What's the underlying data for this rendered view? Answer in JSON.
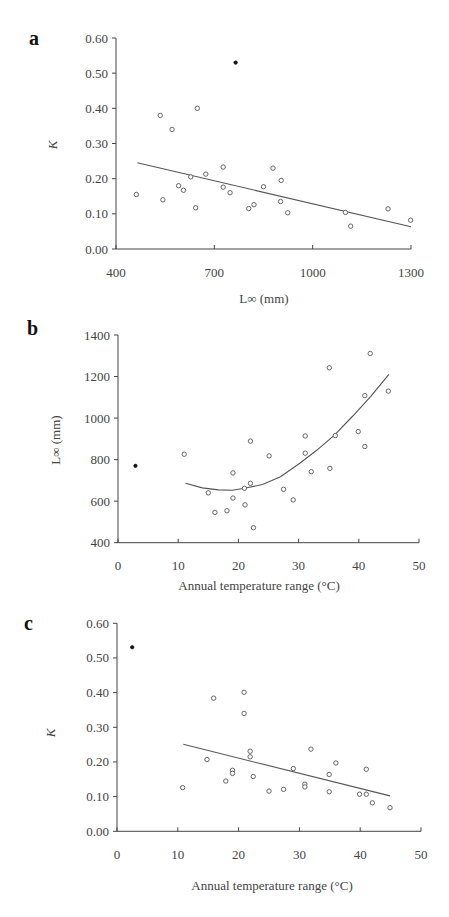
{
  "chart_data": [
    {
      "panel": "a",
      "type": "scatter",
      "title": "",
      "xlabel": "L∞ (mm)",
      "ylabel": "K",
      "xlim": [
        400,
        1300
      ],
      "ylim": [
        0.0,
        0.6
      ],
      "xticks": [
        400,
        700,
        1000,
        1300
      ],
      "xtick_labels": [
        "400",
        "700",
        "1000",
        "1300"
      ],
      "yticks": [
        0.0,
        0.1,
        0.2,
        0.3,
        0.4,
        0.5,
        0.6
      ],
      "ytick_labels": [
        "0.00",
        "0.10",
        "0.20",
        "0.30",
        "0.40",
        "0.50",
        "0.60"
      ],
      "grid": false,
      "legend": null,
      "series": [
        {
          "name": "open",
          "marker": "open-circle",
          "points": [
            [
              462,
              0.155
            ],
            [
              535,
              0.38
            ],
            [
              543,
              0.14
            ],
            [
              571,
              0.34
            ],
            [
              591,
              0.18
            ],
            [
              606,
              0.167
            ],
            [
              628,
              0.205
            ],
            [
              643,
              0.117
            ],
            [
              648,
              0.4
            ],
            [
              674,
              0.213
            ],
            [
              727,
              0.233
            ],
            [
              727,
              0.176
            ],
            [
              748,
              0.16
            ],
            [
              805,
              0.115
            ],
            [
              821,
              0.126
            ],
            [
              850,
              0.177
            ],
            [
              879,
              0.23
            ],
            [
              902,
              0.135
            ],
            [
              904,
              0.195
            ],
            [
              924,
              0.103
            ],
            [
              1100,
              0.104
            ],
            [
              1116,
              0.065
            ],
            [
              1230,
              0.114
            ],
            [
              1299,
              0.082
            ]
          ]
        },
        {
          "name": "outlier",
          "marker": "filled-circle",
          "points": [
            [
              765,
              0.53
            ]
          ]
        }
      ],
      "fit": {
        "type": "linear",
        "points": [
          [
            465,
            0.245
          ],
          [
            1300,
            0.063
          ]
        ]
      }
    },
    {
      "panel": "b",
      "type": "scatter",
      "title": "",
      "xlabel": "Annual temperature range (°C)",
      "ylabel": "L∞ (mm)",
      "xlim": [
        0,
        50
      ],
      "ylim": [
        400,
        1400
      ],
      "xticks": [
        0,
        10,
        20,
        30,
        40,
        50
      ],
      "xtick_labels": [
        "0",
        "10",
        "20",
        "30",
        "40",
        "50"
      ],
      "yticks": [
        400,
        600,
        800,
        1000,
        1200,
        1400
      ],
      "ytick_labels": [
        "400",
        "600",
        "800",
        "1000",
        "1200",
        "1400"
      ],
      "grid": false,
      "legend": null,
      "series": [
        {
          "name": "open",
          "marker": "open-circle",
          "points": [
            [
              11,
              826
            ],
            [
              15,
              640
            ],
            [
              16.1,
              546
            ],
            [
              18.1,
              554
            ],
            [
              19.1,
              736
            ],
            [
              19.1,
              615
            ],
            [
              21,
              662
            ],
            [
              21.1,
              582
            ],
            [
              22,
              889
            ],
            [
              22,
              686
            ],
            [
              22.5,
              472
            ],
            [
              25.1,
              818
            ],
            [
              27.5,
              657
            ],
            [
              29.1,
              606
            ],
            [
              31.1,
              914
            ],
            [
              31.1,
              831
            ],
            [
              32.1,
              742
            ],
            [
              35.1,
              1242
            ],
            [
              35.2,
              758
            ],
            [
              36.1,
              916
            ],
            [
              39.9,
              935
            ],
            [
              41,
              1108
            ],
            [
              41,
              863
            ],
            [
              41.9,
              1311
            ],
            [
              44.9,
              1130
            ]
          ]
        },
        {
          "name": "outlier",
          "marker": "filled-circle",
          "points": [
            [
              2.9,
              770
            ]
          ]
        }
      ],
      "fit": {
        "type": "quadratic",
        "points": [
          [
            11.2,
            686
          ],
          [
            14,
            664
          ],
          [
            16.7,
            654
          ],
          [
            19,
            653
          ],
          [
            21,
            662
          ],
          [
            24,
            680
          ],
          [
            27,
            718
          ],
          [
            30.2,
            783
          ],
          [
            33,
            845
          ],
          [
            36,
            919
          ],
          [
            39,
            1010
          ],
          [
            42,
            1105
          ],
          [
            45,
            1211
          ]
        ]
      }
    },
    {
      "panel": "c",
      "type": "scatter",
      "title": "",
      "xlabel": "Annual temperature range (°C)",
      "ylabel": "K",
      "xlim": [
        0,
        50
      ],
      "ylim": [
        0.0,
        0.6
      ],
      "xticks": [
        0,
        10,
        20,
        30,
        40,
        50
      ],
      "xtick_labels": [
        "0",
        "10",
        "20",
        "30",
        "40",
        "50"
      ],
      "yticks": [
        0.0,
        0.1,
        0.2,
        0.3,
        0.4,
        0.5,
        0.6
      ],
      "ytick_labels": [
        "0.00",
        "0.10",
        "0.20",
        "0.30",
        "0.40",
        "0.50",
        "0.60"
      ],
      "grid": false,
      "legend": null,
      "series": [
        {
          "name": "open",
          "marker": "open-circle",
          "points": [
            [
              10.8,
              0.126
            ],
            [
              14.8,
              0.207
            ],
            [
              15.9,
              0.384
            ],
            [
              17.9,
              0.145
            ],
            [
              19,
              0.176
            ],
            [
              19,
              0.167
            ],
            [
              20.9,
              0.401
            ],
            [
              20.9,
              0.34
            ],
            [
              21.9,
              0.231
            ],
            [
              21.9,
              0.215
            ],
            [
              22.4,
              0.158
            ],
            [
              25,
              0.116
            ],
            [
              27.4,
              0.121
            ],
            [
              29,
              0.181
            ],
            [
              30.9,
              0.136
            ],
            [
              30.9,
              0.128
            ],
            [
              31.9,
              0.237
            ],
            [
              34.9,
              0.164
            ],
            [
              34.9,
              0.114
            ],
            [
              36,
              0.197
            ],
            [
              39.9,
              0.107
            ],
            [
              41,
              0.179
            ],
            [
              41,
              0.107
            ],
            [
              42,
              0.082
            ],
            [
              44.9,
              0.068
            ]
          ]
        },
        {
          "name": "outlier",
          "marker": "filled-circle",
          "points": [
            [
              2.5,
              0.531
            ]
          ]
        }
      ],
      "fit": {
        "type": "linear",
        "points": [
          [
            10.9,
            0.251
          ],
          [
            44.9,
            0.102
          ]
        ]
      }
    }
  ],
  "layout": {
    "panels": [
      {
        "label": "a",
        "label_pos": [
          29,
          45
        ],
        "plot": {
          "x0": 116,
          "x1": 411,
          "y0": 249,
          "y1": 38
        },
        "xtick_label_y": 277,
        "xlabel_pos": [
          264,
          303
        ],
        "ylabel_pos": [
          57,
          145
        ]
      },
      {
        "label": "b",
        "label_pos": [
          27,
          335
        ],
        "plot": {
          "x0": 118,
          "x1": 419,
          "y0": 542.7,
          "y1": 335
        },
        "xtick_label_y": 570,
        "xlabel_pos": [
          259,
          590
        ],
        "ylabel_pos": [
          60,
          440
        ]
      },
      {
        "label": "c",
        "label_pos": [
          24,
          630
        ],
        "plot": {
          "x0": 117,
          "x1": 421,
          "y0": 831.3,
          "y1": 623.3
        },
        "xtick_label_y": 859,
        "xlabel_pos": [
          272,
          890
        ],
        "ylabel_pos": [
          55,
          733
        ]
      }
    ]
  }
}
